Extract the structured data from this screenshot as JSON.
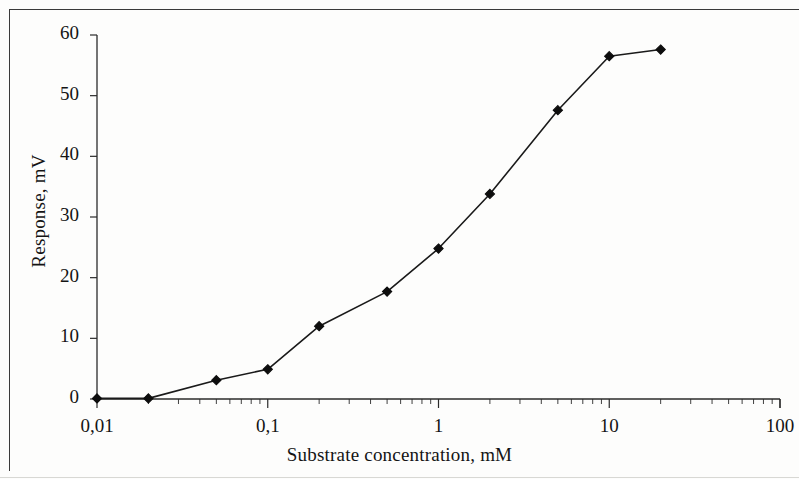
{
  "figure": {
    "axis_color": "#2b2b2b",
    "series_color": "#1a1a1a",
    "marker_color": "#0d0d0d",
    "background": "#fdfdfc"
  },
  "chart_data": {
    "type": "line",
    "title": "",
    "subtitle": "",
    "xlabel": "Substrate concentration, mM",
    "ylabel": "Response, mV",
    "xscale": "log",
    "yscale": "linear",
    "xlim": [
      0.01,
      100
    ],
    "ylim": [
      0,
      60
    ],
    "grid": false,
    "legend": null,
    "marker": "diamond",
    "xtick_labels": [
      "0,01",
      "0,1",
      "1",
      "10",
      "100"
    ],
    "xtick_values": [
      0.01,
      0.1,
      1,
      10,
      100
    ],
    "ytick_labels": [
      "0",
      "10",
      "20",
      "30",
      "40",
      "50",
      "60"
    ],
    "ytick_values": [
      0,
      10,
      20,
      30,
      40,
      50,
      60
    ],
    "x": [
      0.01,
      0.02,
      0.05,
      0.1,
      0.2,
      0.5,
      1,
      2,
      5,
      10,
      20
    ],
    "y": [
      0.1,
      0.1,
      3.1,
      4.9,
      12.0,
      17.7,
      24.8,
      33.8,
      47.6,
      56.5,
      57.6
    ],
    "series": [
      {
        "name": "Response",
        "points": [
          {
            "x": 0.01,
            "y": 0.1
          },
          {
            "x": 0.02,
            "y": 0.1
          },
          {
            "x": 0.05,
            "y": 3.1
          },
          {
            "x": 0.1,
            "y": 4.9
          },
          {
            "x": 0.2,
            "y": 12.0
          },
          {
            "x": 0.5,
            "y": 17.7
          },
          {
            "x": 1,
            "y": 24.8
          },
          {
            "x": 2,
            "y": 33.8
          },
          {
            "x": 5,
            "y": 47.6
          },
          {
            "x": 10,
            "y": 56.5
          },
          {
            "x": 20,
            "y": 57.6
          }
        ]
      }
    ]
  }
}
